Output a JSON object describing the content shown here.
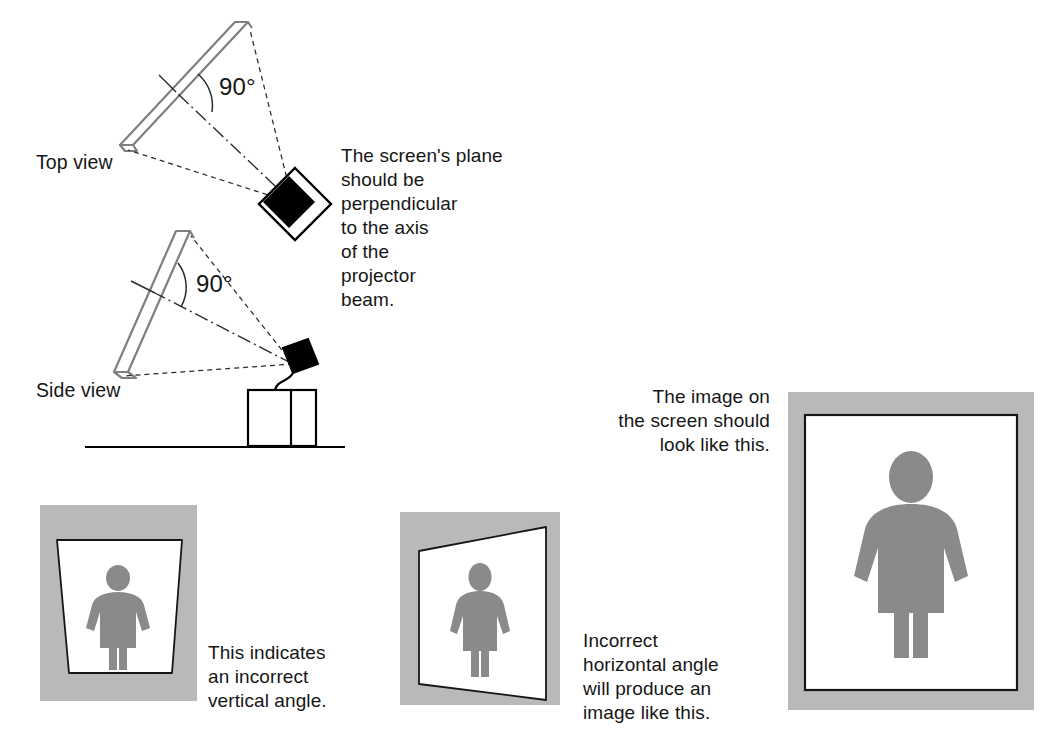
{
  "document": {
    "title": "Projector and screen alignment diagram",
    "background_color": "#ffffff"
  },
  "colors": {
    "ink": "#161616",
    "line": "#7f7f7f",
    "panel_gray": "#b9b9b9",
    "figure_gray": "#8a8a8a",
    "screen_white": "#ffffff",
    "projector_black": "#000000"
  },
  "diagrams": {
    "top_view": {
      "label": "Top view",
      "angle_label": "90°",
      "icon": "projector-diamond-icon"
    },
    "side_view": {
      "label": "Side view",
      "angle_label": "90°",
      "icon": "projector-square-icon"
    },
    "explanation": "The screen's plane\nshould be\nperpendicular\nto the axis\nof the\nprojector\nbeam."
  },
  "panels": [
    {
      "name": "vertical-keystone",
      "caption": "This indicates\nan incorrect\nvertical angle.",
      "distortion": "trapezoid-wide-top",
      "figure": "person-icon"
    },
    {
      "name": "horizontal-keystone",
      "caption": "Incorrect\nhorizontal angle\nwill produce an\nimage like this.",
      "distortion": "trapezoid-tall-right",
      "figure": "person-icon"
    },
    {
      "name": "correct-image",
      "caption": "The image on\nthe screen should\nlook like this.",
      "distortion": "rectangle",
      "figure": "person-icon"
    }
  ]
}
